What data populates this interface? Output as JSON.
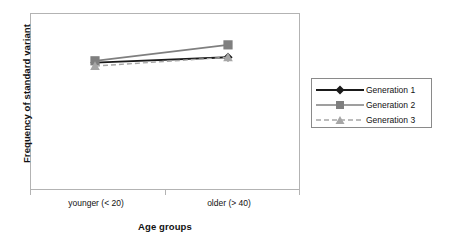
{
  "chart_data": {
    "type": "line",
    "title": "",
    "xlabel": "Age groups",
    "ylabel": "Frequency of standard variant",
    "categories": [
      "younger (< 20)",
      "older (> 40)"
    ],
    "grid": false,
    "legend_position": "right",
    "ylim": [
      0,
      100
    ],
    "yticks": [],
    "ytick_labels": [],
    "series": [
      {
        "name": "Generation 1",
        "values": [
          72,
          75
        ],
        "color": "#1a1a1a",
        "marker": "diamond",
        "linestyle": "solid"
      },
      {
        "name": "Generation 2",
        "values": [
          73,
          82
        ],
        "color": "#7f7f7f",
        "marker": "square",
        "linestyle": "solid"
      },
      {
        "name": "Generation 3",
        "values": [
          70,
          75
        ],
        "color": "#a6a6a6",
        "marker": "triangle",
        "linestyle": "dashed"
      }
    ]
  },
  "axes": {
    "ylabel": "Frequency of standard variant",
    "xlabel": "Age groups",
    "xtick_labels": [
      "younger (< 20)",
      "older (> 40)"
    ]
  },
  "legend": {
    "entries": [
      {
        "label": "Generation 1"
      },
      {
        "label": "Generation 2"
      },
      {
        "label": "Generation 3"
      }
    ]
  },
  "colors": {
    "generation1": "#1a1a1a",
    "generation2": "#7f7f7f",
    "generation3": "#a6a6a6",
    "frame": "#b3b3b3",
    "legend_border": "#8a8a8a",
    "background": "#ffffff"
  }
}
